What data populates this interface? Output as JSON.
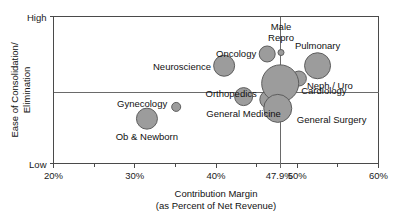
{
  "chart_data": {
    "type": "scatter",
    "title": "",
    "xlabel": "Contribution Margin (as Percent of Net Revenue)",
    "xlabel_line1": "Contribution Margin",
    "xlabel_line2": "(as Percent of Net Revenue)",
    "ylabel": "Ease of Consolidation/ Elimination",
    "ylabel_line1": "Ease of Consolidation/",
    "ylabel_line2": "Elimination",
    "ylim_labels": [
      "Low",
      "High"
    ],
    "y_high_label": "High",
    "y_low_label": "Low",
    "xlim": [
      20,
      60
    ],
    "x_major_ticks": [
      "20%",
      "30%",
      "40%",
      "50%",
      "60%"
    ],
    "x_major_tick_values": [
      20,
      30,
      40,
      50,
      60
    ],
    "x_minor_tick_values": [
      25,
      35,
      45,
      55
    ],
    "grid": false,
    "legend": "none",
    "reference_lines": [
      {
        "axis": "x",
        "value": 47.9,
        "label": "47.9%"
      },
      {
        "axis": "y",
        "value": 0.48,
        "label": ""
      }
    ],
    "bubbles": [
      {
        "name": "Neuroscience",
        "x": 41.0,
        "y": 0.665,
        "size": 10.5,
        "label_pos": "left"
      },
      {
        "name": "Oncology",
        "x": 46.3,
        "y": 0.745,
        "size": 8.0,
        "label_pos": "left"
      },
      {
        "name": "Male Repro",
        "x": 48.0,
        "y": 0.755,
        "size": 3.0,
        "label_pos": "above"
      },
      {
        "name": "Pulmonary",
        "x": 52.5,
        "y": 0.665,
        "size": 13.0,
        "label_pos": "above"
      },
      {
        "name": "Neph / Uro",
        "x": 50.2,
        "y": 0.578,
        "size": 7.5,
        "label_pos": "below"
      },
      {
        "name": "Orthopedics",
        "x": 46.5,
        "y": 0.435,
        "size": 9.0,
        "label_pos": "left"
      },
      {
        "name": "Cardiology",
        "x": 47.9,
        "y": 0.545,
        "size": 18.5,
        "label_pos": "right"
      },
      {
        "name": "General Surgery",
        "x": 47.6,
        "y": 0.375,
        "size": 14.0,
        "label_pos": "right"
      },
      {
        "name": "General Medicine",
        "x": 43.4,
        "y": 0.455,
        "size": 9.0,
        "label_pos": "below"
      },
      {
        "name": "Gynecology",
        "x": 35.1,
        "y": 0.385,
        "size": 4.5,
        "label_pos": "left"
      },
      {
        "name": "Ob & Newborn",
        "x": 31.5,
        "y": 0.305,
        "size": 10.5,
        "label_pos": "below"
      }
    ]
  }
}
